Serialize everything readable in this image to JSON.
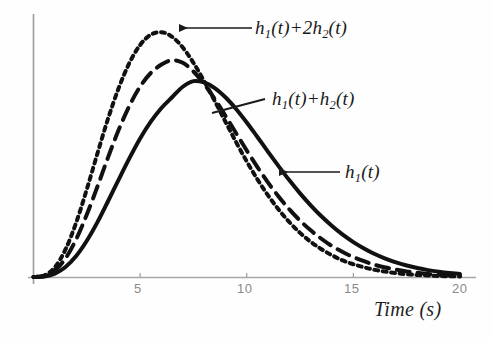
{
  "chart_data": {
    "type": "line",
    "title": "",
    "xlabel": "Time (s)",
    "ylabel": "",
    "xlim": [
      0,
      20.5
    ],
    "ylim": [
      0,
      1.15
    ],
    "grid": false,
    "legend": "annotations-on-curves",
    "xticks": [
      5,
      10,
      15,
      20
    ],
    "xtick_labels": [
      "5",
      "10",
      "15",
      "20"
    ],
    "yticks": [],
    "ytick_labels": [],
    "x": [
      0,
      0.5,
      1,
      1.5,
      2,
      2.5,
      3,
      3.5,
      4,
      4.5,
      5,
      5.5,
      6,
      6.5,
      7,
      7.5,
      8,
      8.5,
      9,
      9.5,
      10,
      10.5,
      11,
      11.5,
      12,
      12.5,
      13,
      13.5,
      14,
      14.5,
      15,
      15.5,
      16,
      16.5,
      17,
      17.5,
      18,
      18.5,
      19,
      19.5,
      20
    ],
    "series": [
      {
        "name": "h_1(t)",
        "label_text": "h1(t)",
        "style": "solid",
        "color": "#111111",
        "linewidth": 4,
        "peak_t": 7.1,
        "peak_value": 0.77,
        "values": [
          0,
          0.002,
          0.013,
          0.039,
          0.082,
          0.142,
          0.215,
          0.298,
          0.383,
          0.466,
          0.543,
          0.609,
          0.663,
          0.705,
          0.746,
          0.768,
          0.763,
          0.741,
          0.705,
          0.659,
          0.606,
          0.549,
          0.491,
          0.434,
          0.379,
          0.328,
          0.281,
          0.238,
          0.2,
          0.166,
          0.137,
          0.112,
          0.09,
          0.072,
          0.057,
          0.045,
          0.035,
          0.027,
          0.021,
          0.016,
          0.012
        ]
      },
      {
        "name": "h_1(t)+h_2(t)",
        "label_text": "h1(t)+h2(t)",
        "style": "dashed",
        "color": "#111111",
        "linewidth": 4,
        "peak_t": 6.0,
        "peak_value": 0.86,
        "values": [
          0,
          0.004,
          0.026,
          0.073,
          0.148,
          0.245,
          0.355,
          0.47,
          0.578,
          0.672,
          0.747,
          0.8,
          0.833,
          0.85,
          0.84,
          0.806,
          0.757,
          0.698,
          0.632,
          0.564,
          0.496,
          0.431,
          0.37,
          0.315,
          0.265,
          0.221,
          0.183,
          0.15,
          0.121,
          0.098,
          0.078,
          0.062,
          0.048,
          0.037,
          0.029,
          0.022,
          0.017,
          0.012,
          0.009,
          0.007,
          0.005
        ]
      },
      {
        "name": "h_1(t)+2h_2(t)",
        "label_text": "h1(t)+2h2(t)",
        "style": "dotted",
        "color": "#111111",
        "linewidth": 4,
        "peak_t": 5.3,
        "peak_value": 1.0,
        "values": [
          0,
          0.006,
          0.038,
          0.108,
          0.213,
          0.344,
          0.485,
          0.622,
          0.742,
          0.84,
          0.91,
          0.95,
          0.96,
          0.942,
          0.9,
          0.84,
          0.768,
          0.69,
          0.609,
          0.529,
          0.453,
          0.383,
          0.32,
          0.264,
          0.215,
          0.173,
          0.138,
          0.109,
          0.085,
          0.065,
          0.05,
          0.038,
          0.028,
          0.021,
          0.015,
          0.011,
          0.008,
          0.006,
          0.004,
          0.003,
          0.002
        ]
      }
    ],
    "annotations": [
      {
        "id": "annot-h1-2h2",
        "target_series": "h_1(t)+2h_2(t)",
        "text_main": "h",
        "text_sub1": "1",
        "text_mid": "(t)+2h",
        "text_sub2": "2",
        "text_end": "(t)",
        "full_text": "h1(t)+2h2(t)",
        "leader": "arrow-left"
      },
      {
        "id": "annot-h1-h2",
        "target_series": "h_1(t)+h_2(t)",
        "text_main": "h",
        "text_sub1": "1",
        "text_mid": "(t)+h",
        "text_sub2": "2",
        "text_end": "(t)",
        "full_text": "h1(t)+h2(t)",
        "leader": "line-diagonal"
      },
      {
        "id": "annot-h1",
        "target_series": "h_1(t)",
        "text_main": "h",
        "text_sub1": "1",
        "text_mid": "(t)",
        "text_sub2": "",
        "text_end": "",
        "full_text": "h1(t)",
        "leader": "arrow-left"
      }
    ],
    "colors": {
      "curve": "#111111",
      "axis": "#9c9c9c",
      "tick_text": "#8a8a8a",
      "annotation_text": "#1a1a1a",
      "background": "#fefefe"
    }
  },
  "axis": {
    "xlabel": "Time (s)",
    "ticks": [
      {
        "label": "5"
      },
      {
        "label": "10"
      },
      {
        "label": "15"
      },
      {
        "label": "20"
      }
    ]
  },
  "annotations": {
    "a1": {
      "h": "h",
      "s1": "1",
      "mid": "(t)+2h",
      "s2": "2",
      "end": "(t)"
    },
    "a2": {
      "h": "h",
      "s1": "1",
      "mid": "(t)+h",
      "s2": "2",
      "end": "(t)"
    },
    "a3": {
      "h": "h",
      "s1": "1",
      "mid": "(t)"
    }
  }
}
